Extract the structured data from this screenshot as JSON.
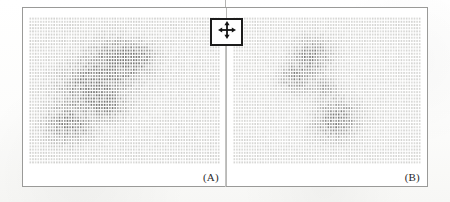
{
  "figure": {
    "title": "",
    "panels": [
      {
        "id": "A",
        "label": "(A)",
        "name": "panel-a",
        "density_peak": 0.92,
        "blob_count": 3
      },
      {
        "id": "B",
        "label": "(B)",
        "name": "panel-b",
        "density_peak": 0.78,
        "blob_count": 3
      }
    ]
  },
  "cursor_widget": {
    "icon": "move-four-way-arrow-icon",
    "tooltip": "Move",
    "border_color": "#1c1c1c",
    "background": "#ffffff"
  },
  "colors": {
    "frame": "#9a9a98",
    "divider": "#b9b9b7",
    "dot_light": "#e9e9e7",
    "dot_dark": "#7b7b79",
    "paper": "#fbfbfa",
    "label_text": "#2a2a2a"
  },
  "chart_data": {
    "type": "heatmap",
    "title": "",
    "xlabel": "",
    "ylabel": "",
    "grid": true,
    "legend": "none",
    "grid_cols": 72,
    "grid_rows": 46,
    "value_range": [
      0,
      1
    ],
    "panels": [
      {
        "name": "(A)",
        "cols": 72,
        "rows": 46,
        "blobs": [
          {
            "cx": 0.47,
            "cy": 0.3,
            "rx": 0.16,
            "ry": 0.15,
            "amp": 0.9,
            "rot": 20
          },
          {
            "cx": 0.33,
            "cy": 0.47,
            "rx": 0.17,
            "ry": 0.16,
            "amp": 0.88,
            "rot": -15
          },
          {
            "cx": 0.21,
            "cy": 0.73,
            "rx": 0.13,
            "ry": 0.13,
            "amp": 0.8,
            "rot": 35
          },
          {
            "cx": 0.58,
            "cy": 0.27,
            "rx": 0.09,
            "ry": 0.08,
            "amp": 0.55,
            "rot": 0
          },
          {
            "cx": 0.41,
            "cy": 0.61,
            "rx": 0.1,
            "ry": 0.09,
            "amp": 0.62,
            "rot": 10
          }
        ],
        "baseline": 0.13
      },
      {
        "name": "(B)",
        "cols": 72,
        "rows": 46,
        "blobs": [
          {
            "cx": 0.42,
            "cy": 0.27,
            "rx": 0.11,
            "ry": 0.13,
            "amp": 0.8,
            "rot": 15
          },
          {
            "cx": 0.33,
            "cy": 0.42,
            "rx": 0.09,
            "ry": 0.1,
            "amp": 0.66,
            "rot": -20
          },
          {
            "cx": 0.55,
            "cy": 0.7,
            "rx": 0.12,
            "ry": 0.14,
            "amp": 0.84,
            "rot": 25
          },
          {
            "cx": 0.49,
            "cy": 0.49,
            "rx": 0.07,
            "ry": 0.08,
            "amp": 0.5,
            "rot": 0
          }
        ],
        "baseline": 0.11
      }
    ]
  }
}
